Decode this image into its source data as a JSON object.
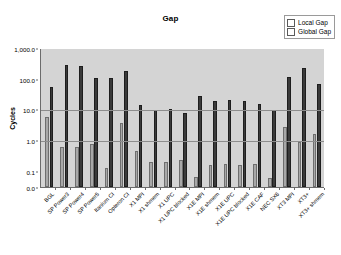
{
  "chart_data": {
    "type": "bar",
    "title": "Gap",
    "xlabel": "",
    "ylabel": "Cycles",
    "yscale": "log",
    "ylim": [
      0.03,
      1000
    ],
    "ytick_labels": [
      "1,000.0",
      "100.0",
      "10.0",
      "1.0",
      "0.1",
      "0.0"
    ],
    "ytick_values": [
      1000,
      100,
      10,
      1,
      0.1,
      0.03
    ],
    "grid": true,
    "legend_position": "top-right",
    "categories": [
      "BGL",
      "SP Power3",
      "SP Power4",
      "SP Power5",
      "Itanium CI",
      "Opteron CI",
      "X1 MPI",
      "X1 shmem",
      "X1 UPC",
      "X1 UPC blocked",
      "X1E MPI",
      "X1E shmem",
      "X1E UPC",
      "X1E UPC blocked",
      "X1E CAF",
      "NEC SX6",
      "XT3 MPI",
      "XT3+",
      "XT3+ shmem"
    ],
    "series": [
      {
        "name": "Local Gap",
        "color": "#a8a8a8",
        "values": [
          5.5,
          0.58,
          0.6,
          0.75,
          0.125,
          3.5,
          0.44,
          0.2,
          0.2,
          0.22,
          0.065,
          0.16,
          0.17,
          0.16,
          0.17,
          0.06,
          2.6,
          0.85,
          1.6
        ]
      },
      {
        "name": "Global Gap",
        "color": "#3a3a3a",
        "values": [
          55,
          270,
          265,
          105,
          102,
          175,
          14,
          9.8,
          10.3,
          7.5,
          28,
          19,
          21,
          19,
          15,
          9.6,
          115,
          230,
          70
        ]
      }
    ]
  }
}
